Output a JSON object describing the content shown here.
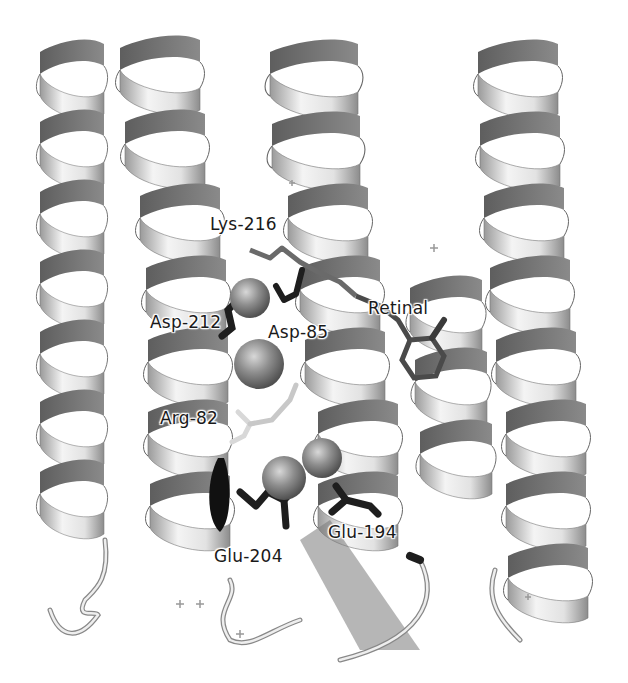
{
  "figure": {
    "labels": [
      {
        "id": "lys216",
        "text": "Lys-216",
        "x": 210,
        "y": 214
      },
      {
        "id": "asp212",
        "text": "Asp-212",
        "x": 150,
        "y": 312
      },
      {
        "id": "asp85",
        "text": "Asp-85",
        "x": 268,
        "y": 322
      },
      {
        "id": "retinal",
        "text": "Retinal",
        "x": 368,
        "y": 298
      },
      {
        "id": "arg82",
        "text": "Arg-82",
        "x": 160,
        "y": 408
      },
      {
        "id": "glu204",
        "text": "Glu-204",
        "x": 214,
        "y": 546
      },
      {
        "id": "glu194",
        "text": "Glu-194",
        "x": 328,
        "y": 522
      }
    ],
    "colors": {
      "background": "#ffffff",
      "ribbon_light": "#f2f2f2",
      "ribbon_mid": "#b8b8b8",
      "ribbon_dark": "#6e6e6e",
      "sidechain_dark": "#1e1e1e",
      "sidechain_mid": "#5a5a5a",
      "sidechain_light": "#e0e0e0",
      "sphere": "#8a8a8a"
    }
  }
}
